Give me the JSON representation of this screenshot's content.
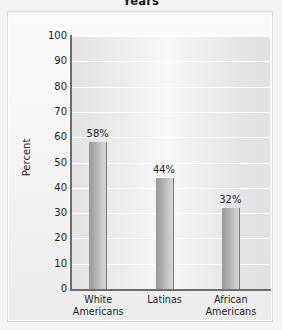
{
  "chart_data": {
    "type": "bar",
    "title": "Years",
    "xlabel": "",
    "ylabel": "Percent",
    "categories": [
      "White Americans",
      "Latinas",
      "African Americans"
    ],
    "category_lines": [
      [
        "White",
        "Americans"
      ],
      [
        "Latinas"
      ],
      [
        "African",
        "Americans"
      ]
    ],
    "values": [
      58,
      44,
      32
    ],
    "value_labels": [
      "58%",
      "44%",
      "32%"
    ],
    "ylim": [
      0,
      100
    ],
    "yticks": [
      100,
      90,
      80,
      70,
      60,
      50,
      40,
      30,
      20,
      10,
      0
    ],
    "ytick_labels": [
      "100",
      "90",
      "80",
      "70",
      "60",
      "50",
      "40",
      "30",
      "20",
      "10",
      "0"
    ],
    "grid": true,
    "gridline_color": "#fdfdfd",
    "legend": null,
    "legend_position": "none",
    "bar_color": "#b4b4b4",
    "bar_edge_color": "#7d7d7d",
    "plot_background": "#efefef",
    "figure_background": "#f4f4f4",
    "text_color": "#231f20",
    "axis_color": "#6d6d6d"
  }
}
